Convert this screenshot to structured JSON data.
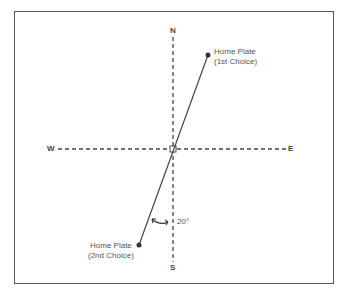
{
  "diagram": {
    "compass": {
      "north": "N",
      "south": "S",
      "east": "E",
      "west": "W"
    },
    "points": [
      {
        "label_line1": "Home Plate",
        "label_line2": "(1st Choice)"
      },
      {
        "label_line1": "Home Plate",
        "label_line2": "(2nd Choice)"
      }
    ],
    "angle_label": "20°",
    "colors": {
      "line": "#444444",
      "text": "#555555",
      "frame": "#555555"
    }
  }
}
